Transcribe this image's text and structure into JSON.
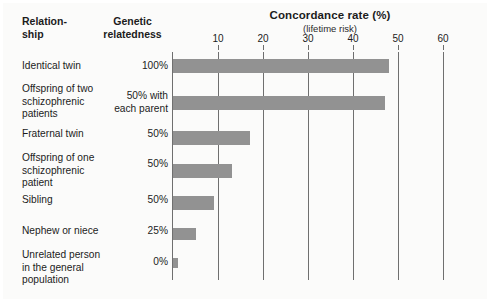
{
  "figure": {
    "columns": {
      "relationship_header": "Relation-\nship",
      "genetic_header": "Genetic\nrelatedness"
    },
    "axis": {
      "title": "Concordance rate (%)",
      "subtitle": "(lifetime risk)",
      "ticks": [
        10,
        20,
        30,
        40,
        50,
        60
      ],
      "min": 0,
      "max": 65
    },
    "colors": {
      "bar": "#929292",
      "gridline": "#6f6f6f",
      "background": "#fbfbfa",
      "text": "#1c1c1c"
    }
  },
  "chart_data": {
    "type": "bar",
    "orientation": "horizontal",
    "title": "Concordance rate (%)",
    "subtitle": "(lifetime risk)",
    "xlabel": "Concordance rate (%)",
    "ylabel": "Relationship",
    "xlim": [
      0,
      65
    ],
    "xticks": [
      10,
      20,
      30,
      40,
      50,
      60
    ],
    "grid": true,
    "legend": false,
    "categories": [
      "Identical twin",
      "Offspring of two schizophrenic patients",
      "Fraternal twin",
      "Offspring of one schizophrenic patient",
      "Sibling",
      "Nephew or niece",
      "Unrelated person in the general population"
    ],
    "values": [
      48,
      47,
      17,
      13,
      9,
      5,
      1
    ],
    "genetic_relatedness": [
      "100%",
      "50% with each parent",
      "50%",
      "50%",
      "50%",
      "25%",
      "0%"
    ],
    "rows": [
      {
        "label": "Identical twin",
        "label_lines": [
          "Identical twin"
        ],
        "genetic": "100%",
        "genetic_lines": [
          "100%"
        ],
        "value": 48
      },
      {
        "label": "Offspring of two schizophrenic patients",
        "label_lines": [
          "Offspring of two",
          "schizophrenic",
          "patients"
        ],
        "genetic": "50% with each parent",
        "genetic_lines": [
          "50% with",
          "each parent"
        ],
        "value": 47
      },
      {
        "label": "Fraternal twin",
        "label_lines": [
          "Fraternal twin"
        ],
        "genetic": "50%",
        "genetic_lines": [
          "50%"
        ],
        "value": 17
      },
      {
        "label": "Offspring of one schizophrenic patient",
        "label_lines": [
          "Offspring of one",
          "schizophrenic",
          "patient"
        ],
        "genetic": "50%",
        "genetic_lines": [
          "50%"
        ],
        "value": 13
      },
      {
        "label": "Sibling",
        "label_lines": [
          "Sibling"
        ],
        "genetic": "50%",
        "genetic_lines": [
          "50%"
        ],
        "value": 9
      },
      {
        "label": "Nephew or niece",
        "label_lines": [
          "Nephew or niece"
        ],
        "genetic": "25%",
        "genetic_lines": [
          "25%"
        ],
        "value": 5
      },
      {
        "label": "Unrelated person in the general population",
        "label_lines": [
          "Unrelated person",
          "in the general",
          "population"
        ],
        "genetic": "0%",
        "genetic_lines": [
          "0%"
        ],
        "value": 1
      }
    ]
  }
}
